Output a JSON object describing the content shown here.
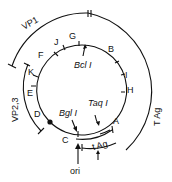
{
  "diagram": {
    "title": "",
    "fragments": [
      "A",
      "B",
      "C",
      "D",
      "E",
      "F",
      "G",
      "H",
      "I",
      "J",
      "K"
    ],
    "enzymes": {
      "bcl": "Bcl I",
      "bgl": "Bgl I",
      "taq": "Taq I"
    },
    "origin": "ori",
    "genes": {
      "vp1": "VP1",
      "vp23": "VP2,3",
      "tag_large": "T Ag",
      "tag_small": "t Ag"
    }
  }
}
